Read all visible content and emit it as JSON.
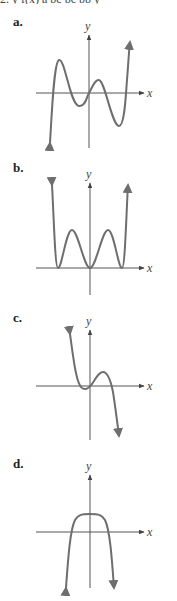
{
  "header_fragment": "2. y f(x)     a     bc     bc   bb y",
  "panels": [
    {
      "label": "a.",
      "x_axis_label": "x",
      "y_axis_label": "y",
      "description": "odd-degree polynomial rising to the right with two local maxima and two local minima, passing through origin"
    },
    {
      "label": "b.",
      "x_axis_label": "x",
      "y_axis_label": "y",
      "description": "even-degree polynomial with double roots at three points touching x-axis, both ends rising"
    },
    {
      "label": "c.",
      "x_axis_label": "x",
      "y_axis_label": "y",
      "description": "odd-degree polynomial falling to the right, local min near origin and local max right of origin"
    },
    {
      "label": "d.",
      "x_axis_label": "x",
      "y_axis_label": "y",
      "description": "even-degree polynomial with flat top above origin, both ends falling"
    }
  ],
  "colors": {
    "curve": "#6e6e6e",
    "axis": "#555555",
    "text": "#222222"
  }
}
